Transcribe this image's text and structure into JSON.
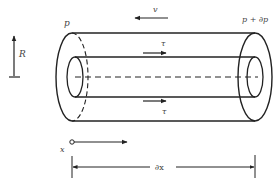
{
  "diagram": {
    "labels": {
      "pressure_left": "p",
      "pressure_right": "p + ∂p",
      "velocity": "v",
      "shear_top": "τ",
      "shear_bottom": "τ",
      "radius": "R",
      "axis": "x",
      "length": "∂x"
    },
    "colors": {
      "stroke": "#222222",
      "text": "#444444",
      "background": "#ffffff"
    }
  }
}
